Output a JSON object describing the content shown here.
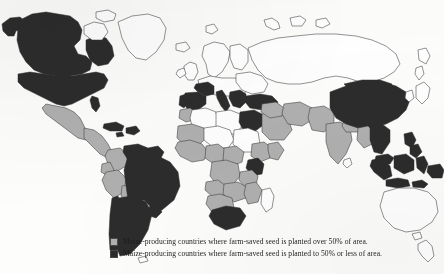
{
  "figure": {
    "type": "world-choropleth-map",
    "projection": "equirectangular",
    "background_color": "#fdfdfc",
    "outline_color": "#3a3a3a"
  },
  "legend": {
    "position": "bottom-center",
    "items": [
      {
        "swatch": "light-gray-swatch",
        "color": "#b0b0b0",
        "label": "Maize-producing countries where farm-saved seed is planted over 50% of area."
      },
      {
        "swatch": "dark-gray-swatch",
        "color": "#2c2c2c",
        "label": "Maize-producing countries where farm-saved seed is planted to 50% or less of area."
      }
    ]
  },
  "map_data": {
    "categories": [
      {
        "key": "over50",
        "color": "#b0b0b0",
        "description": "farm-saved seed planted over 50% of area"
      },
      {
        "key": "upto50",
        "color": "#2c2c2c",
        "description": "farm-saved seed planted to 50% or less of area"
      },
      {
        "key": "none",
        "color": "#ffffff",
        "description": "not shaded / not a maize-producing country in this dataset"
      }
    ],
    "regions": [
      {
        "name": "Canada",
        "category": "upto50"
      },
      {
        "name": "Alaska",
        "category": "upto50"
      },
      {
        "name": "United States",
        "category": "upto50"
      },
      {
        "name": "Mexico",
        "category": "over50"
      },
      {
        "name": "Central America",
        "category": "over50"
      },
      {
        "name": "Cuba",
        "category": "upto50"
      },
      {
        "name": "Hispaniola",
        "category": "upto50"
      },
      {
        "name": "Colombia",
        "category": "over50"
      },
      {
        "name": "Venezuela",
        "category": "upto50"
      },
      {
        "name": "Guyanas",
        "category": "upto50"
      },
      {
        "name": "Ecuador",
        "category": "over50"
      },
      {
        "name": "Peru",
        "category": "over50"
      },
      {
        "name": "Bolivia",
        "category": "over50"
      },
      {
        "name": "Brazil",
        "category": "upto50"
      },
      {
        "name": "Paraguay",
        "category": "over50"
      },
      {
        "name": "Chile",
        "category": "upto50"
      },
      {
        "name": "Argentina",
        "category": "upto50"
      },
      {
        "name": "Uruguay",
        "category": "upto50"
      },
      {
        "name": "Portugal",
        "category": "upto50"
      },
      {
        "name": "Spain",
        "category": "upto50"
      },
      {
        "name": "France",
        "category": "upto50"
      },
      {
        "name": "Italy",
        "category": "upto50"
      },
      {
        "name": "Balkans",
        "category": "upto50"
      },
      {
        "name": "Greece",
        "category": "upto50"
      },
      {
        "name": "Turkey",
        "category": "upto50"
      },
      {
        "name": "Northern Europe",
        "category": "none"
      },
      {
        "name": "Russia",
        "category": "none"
      },
      {
        "name": "Morocco",
        "category": "over50"
      },
      {
        "name": "Algeria",
        "category": "none"
      },
      {
        "name": "Libya",
        "category": "none"
      },
      {
        "name": "Egypt",
        "category": "upto50"
      },
      {
        "name": "Sudan",
        "category": "none"
      },
      {
        "name": "Ethiopia",
        "category": "over50"
      },
      {
        "name": "Somalia",
        "category": "over50"
      },
      {
        "name": "West Africa",
        "category": "over50"
      },
      {
        "name": "Nigeria",
        "category": "over50"
      },
      {
        "name": "Cameroon",
        "category": "over50"
      },
      {
        "name": "DR Congo",
        "category": "over50"
      },
      {
        "name": "Kenya",
        "category": "upto50"
      },
      {
        "name": "Tanzania",
        "category": "over50"
      },
      {
        "name": "Angola",
        "category": "over50"
      },
      {
        "name": "Zambia",
        "category": "over50"
      },
      {
        "name": "Zimbabwe",
        "category": "over50"
      },
      {
        "name": "Mozambique",
        "category": "over50"
      },
      {
        "name": "South Africa",
        "category": "upto50"
      },
      {
        "name": "Madagascar",
        "category": "none"
      },
      {
        "name": "Saudi Arabia",
        "category": "over50"
      },
      {
        "name": "Iran",
        "category": "over50"
      },
      {
        "name": "Afghanistan",
        "category": "over50"
      },
      {
        "name": "Pakistan",
        "category": "over50"
      },
      {
        "name": "India",
        "category": "over50"
      },
      {
        "name": "Nepal",
        "category": "over50"
      },
      {
        "name": "Bangladesh",
        "category": "over50"
      },
      {
        "name": "China",
        "category": "upto50"
      },
      {
        "name": "Myanmar",
        "category": "over50"
      },
      {
        "name": "Thailand",
        "category": "upto50"
      },
      {
        "name": "Vietnam",
        "category": "upto50"
      },
      {
        "name": "Malaysia",
        "category": "upto50"
      },
      {
        "name": "Indonesia",
        "category": "upto50"
      },
      {
        "name": "Philippines",
        "category": "upto50"
      },
      {
        "name": "Papua New Guinea",
        "category": "upto50"
      },
      {
        "name": "Japan",
        "category": "none"
      },
      {
        "name": "Korea",
        "category": "none"
      },
      {
        "name": "Australia",
        "category": "none"
      },
      {
        "name": "New Zealand",
        "category": "none"
      },
      {
        "name": "Greenland",
        "category": "none"
      }
    ]
  }
}
